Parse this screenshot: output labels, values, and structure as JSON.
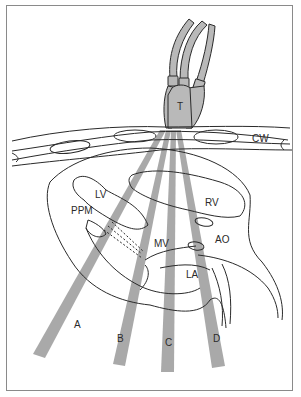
{
  "figure": {
    "colors": {
      "line": "#2a2a2a",
      "beam_fill": "#a9a9a9",
      "transducer_fill": "#b9b9b9",
      "frame": "#8a8a8a",
      "background": "#ffffff"
    },
    "labels": {
      "transducer": "T",
      "chest_wall": "CW",
      "left_ventricle": "LV",
      "right_ventricle": "RV",
      "posterior_papillary_muscle": "PPM",
      "mitral_valve": "MV",
      "aorta": "AO",
      "left_atrium": "LA"
    },
    "beams": [
      {
        "label": "A"
      },
      {
        "label": "B"
      },
      {
        "label": "C"
      },
      {
        "label": "D"
      }
    ]
  }
}
